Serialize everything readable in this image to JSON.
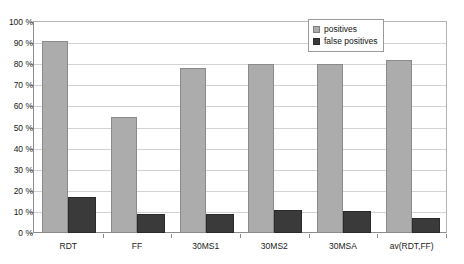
{
  "chart_data": {
    "type": "bar",
    "title": "",
    "xlabel": "",
    "ylabel": "",
    "ylim": [
      0,
      100
    ],
    "ytick_labels": [
      "100 %",
      "90 %",
      "80 %",
      "70 %",
      "60 %",
      "50 %",
      "40 %",
      "30 %",
      "20 %",
      "10 %",
      "0 %"
    ],
    "ytick_values": [
      100,
      90,
      80,
      70,
      60,
      50,
      40,
      30,
      20,
      10,
      0
    ],
    "grid": true,
    "legend_position": "top-right",
    "categories": [
      "RDT",
      "FF",
      "30MS1",
      "30MS2",
      "30MSA",
      "av(RDT,FF)"
    ],
    "series": [
      {
        "name": "positives",
        "color": "#acacac",
        "values": [
          91,
          55,
          78,
          80,
          80,
          82
        ]
      },
      {
        "name": "false positives",
        "color": "#3a3a3a",
        "values": [
          17,
          9,
          9,
          11,
          10.5,
          7
        ]
      }
    ]
  },
  "legend": {
    "items": [
      {
        "label": "positives",
        "swatch": "sw-positives"
      },
      {
        "label": "false positives",
        "swatch": "sw-false"
      }
    ]
  }
}
